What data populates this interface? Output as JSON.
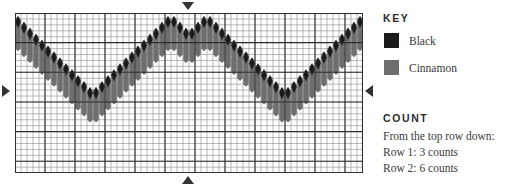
{
  "legend": {
    "key_title": "KEY",
    "entries": [
      {
        "label": "Black",
        "color": "#1b1b1b",
        "swatch_name": "black-swatch"
      },
      {
        "label": "Cinnamon",
        "color": "#6e6e6e",
        "swatch_name": "cinnamon-swatch"
      }
    ],
    "count_title": "COUNT",
    "count_lines": [
      "From the top row down:",
      "Row 1: 3 counts",
      "Row 2: 6 counts"
    ]
  },
  "markers": {
    "top": "repeat-marker-down",
    "bottom": "repeat-marker-up",
    "left": "repeat-marker-right",
    "right": "repeat-marker-left"
  },
  "chart_data": {
    "type": "heatmap",
    "title": "",
    "subtitle": "",
    "xlabel": "",
    "ylabel": "",
    "grid": true,
    "legend_position": "right",
    "columns": 58,
    "rows": 27,
    "cell_width": 6,
    "cell_height": 5.93,
    "xlim": [
      0,
      58
    ],
    "ylim": [
      0,
      27
    ],
    "minor_gridline_color": "#8c8c8c",
    "major_gridline_color": "#2f2f2f",
    "major_gridline_every": 5,
    "plot_background": "#ffffff",
    "colors": {
      "black": "#1b1b1b",
      "cinnamon": "#6e6e6e"
    },
    "series": [
      {
        "name": "Black",
        "color": "#1b1b1b",
        "shape": "diamond",
        "description": "Upper chevron wave of black diamond beads, peak at center column.",
        "x": [
          0,
          1,
          2,
          3,
          4,
          5,
          6,
          7,
          8,
          9,
          10,
          11,
          12,
          13,
          14,
          15,
          16,
          17,
          18,
          19,
          20,
          21,
          22,
          23,
          24,
          25,
          26,
          27,
          28,
          29,
          30,
          31,
          32,
          33,
          34,
          35,
          36,
          37,
          38,
          39,
          40,
          41,
          42,
          43,
          44,
          45,
          46,
          47,
          48,
          49,
          50,
          51,
          52,
          53,
          54,
          55,
          56,
          57
        ],
        "values": [
          1,
          2,
          3,
          4,
          5,
          6,
          7,
          8,
          9,
          10,
          11,
          12,
          13,
          13,
          12,
          11,
          10,
          9,
          8,
          7,
          6,
          5,
          4,
          3,
          2,
          1,
          1,
          2,
          3,
          3,
          2,
          1,
          1,
          2,
          3,
          4,
          5,
          6,
          7,
          8,
          9,
          10,
          11,
          12,
          13,
          13,
          12,
          11,
          10,
          9,
          8,
          7,
          6,
          5,
          4,
          3,
          2,
          1
        ]
      },
      {
        "name": "Cinnamon",
        "color": "#6e6e6e",
        "shape": "column",
        "description": "Lower chevron wave of cinnamon columns, offset four rows below the black wave.",
        "x": [
          0,
          1,
          2,
          3,
          4,
          5,
          6,
          7,
          8,
          9,
          10,
          11,
          12,
          13,
          14,
          15,
          16,
          17,
          18,
          19,
          20,
          21,
          22,
          23,
          24,
          25,
          26,
          27,
          28,
          29,
          30,
          31,
          32,
          33,
          34,
          35,
          36,
          37,
          38,
          39,
          40,
          41,
          42,
          43,
          44,
          45,
          46,
          47,
          48,
          49,
          50,
          51,
          52,
          53,
          54,
          55,
          56,
          57
        ],
        "values": [
          5,
          6,
          7,
          8,
          9,
          10,
          11,
          12,
          13,
          14,
          15,
          16,
          17,
          17,
          16,
          15,
          14,
          13,
          12,
          11,
          10,
          9,
          8,
          7,
          6,
          5,
          5,
          6,
          7,
          7,
          6,
          5,
          5,
          6,
          7,
          8,
          9,
          10,
          11,
          12,
          13,
          14,
          15,
          16,
          17,
          17,
          16,
          15,
          14,
          13,
          12,
          11,
          10,
          9,
          8,
          7,
          6,
          5
        ],
        "bar_span_rows": 4
      }
    ]
  }
}
